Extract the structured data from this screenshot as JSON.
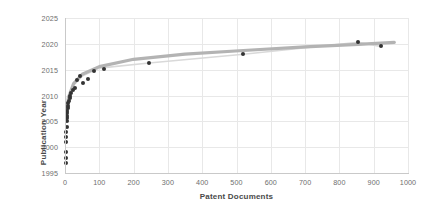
{
  "chart_data": {
    "type": "scatter",
    "title": "",
    "xlabel": "Patent Documents",
    "ylabel": "Publication Year",
    "xlim": [
      0,
      1000
    ],
    "ylim": [
      1995,
      2025
    ],
    "grid": true,
    "legend": false,
    "xticks": [
      "0",
      "100",
      "200",
      "300",
      "400",
      "500",
      "600",
      "700",
      "800",
      "900",
      "1000"
    ],
    "yticks": [
      "1995",
      "2000",
      "2005",
      "2010",
      "2015",
      "2020",
      "2025"
    ],
    "point_color": "#333333",
    "trendline_color": "#b3b3b3",
    "connector_color": "#d9d9d9",
    "gridline_color": "#e8e8e8",
    "series": [
      {
        "name": "Patent documents by publication year",
        "x": [
          2,
          2,
          3,
          3,
          4,
          4,
          5,
          5,
          6,
          6,
          7,
          7,
          8,
          9,
          10,
          11,
          13,
          15,
          18,
          22,
          28,
          35,
          44,
          52,
          68,
          85,
          115,
          245,
          520,
          855,
          920
        ],
        "y": [
          1997,
          1998,
          1999,
          2001,
          2002,
          2003,
          2004,
          2005,
          2005.6,
          2006,
          2006.6,
          2007,
          2007.5,
          2008,
          2008.5,
          2009,
          2009.5,
          2010,
          2010.5,
          2011,
          2011.5,
          2013,
          2013.8,
          2012.4,
          2013.3,
          2014.7,
          2015.2,
          2016.3,
          2018,
          2020.3,
          2019.5
        ]
      }
    ],
    "trendline": {
      "name": "Logarithmic trend",
      "type": "log",
      "x": [
        3,
        10,
        25,
        50,
        100,
        200,
        350,
        520,
        700,
        855,
        960
      ],
      "y": [
        2005.2,
        2009.6,
        2012.3,
        2014.1,
        2015.6,
        2017.0,
        2018.0,
        2018.7,
        2019.4,
        2019.9,
        2020.3
      ]
    },
    "connector": {
      "name": "Point connector",
      "x": [
        3,
        10,
        25,
        50,
        100,
        245,
        520,
        855,
        920
      ],
      "y": [
        2004.8,
        2009.2,
        2012.0,
        2013.8,
        2015.3,
        2016.3,
        2018.0,
        2020.3,
        2019.5
      ]
    }
  }
}
